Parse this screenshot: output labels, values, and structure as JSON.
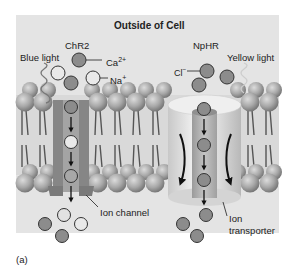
{
  "figure": {
    "panel_label": "(a)",
    "title": "Outside of Cell",
    "background_color": "#e4e4e4",
    "colors": {
      "membrane_head": "#a9a9a9",
      "channel": "#8a8a8a",
      "transporter": "#d2d2d2",
      "ion_dark": "#8c8c8c",
      "ion_light": "#e9e9e9"
    }
  },
  "left": {
    "protein_name": "ChR2",
    "light_label": "Blue light",
    "ion_labels": {
      "calcium": "Ca",
      "calcium_sup": "2+",
      "sodium": "Na",
      "sodium_sup": "+"
    },
    "structure_label": "Ion channel"
  },
  "right": {
    "protein_name": "NpHR",
    "light_label": "Yellow light",
    "ion_labels": {
      "chloride": "Cl",
      "chloride_sup": "−"
    },
    "structure_label_line1": "Ion",
    "structure_label_line2": "transporter"
  }
}
